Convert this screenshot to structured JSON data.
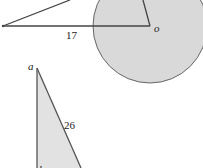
{
  "figure_top": {
    "circle": {
      "cx": 150,
      "cy": 26,
      "r": 57,
      "fill": "#d9d9d9",
      "stroke": "#666666"
    },
    "segments": [
      {
        "x1": 3,
        "y1": 26,
        "x2": 150,
        "y2": 26
      },
      {
        "x1": 3,
        "y1": 26,
        "x2": 70,
        "y2": 0
      },
      {
        "x1": 143,
        "y1": 0,
        "x2": 150,
        "y2": 26
      }
    ],
    "labels": {
      "center": "o",
      "length": "17",
      "left_point": "p"
    }
  },
  "figure_bottom": {
    "triangle": {
      "fill": "#e2e2e2",
      "stroke": "#555555"
    },
    "labels": {
      "apex": "a",
      "hypotenuse": "26",
      "bottom_partial": "b"
    }
  },
  "colors": {
    "line": "#444444",
    "circle_fill": "#d9d9d9",
    "triangle_fill": "#e2e2e2",
    "background": "#ffffff"
  }
}
